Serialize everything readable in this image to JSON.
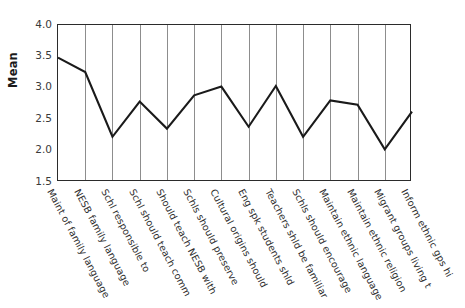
{
  "chart_data": {
    "type": "line",
    "title": "",
    "xlabel": "",
    "ylabel": "Mean",
    "ylim": [
      1.5,
      4.0
    ],
    "yticks": [
      "4.0",
      "3.5",
      "3.0",
      "2.5",
      "2.0",
      "1.5"
    ],
    "ytick_values": [
      4.0,
      3.5,
      3.0,
      2.5,
      2.0,
      1.5
    ],
    "grid": "vertical",
    "legend": "none",
    "categories": [
      "Maint of family language",
      "NESB family language",
      "Schl responsible to",
      "Schl should teach comm",
      "Should teach NESB with",
      "Schls should preserve",
      "Cultural origins should",
      "Eng spk students shld",
      "Teachers shld be familiar",
      "Schls should encourage",
      "Maintain ethnic language",
      "Maintain ethnic religion",
      "Migrant groups living t",
      "Inform ethnic gps hi"
    ],
    "values": [
      3.48,
      3.25,
      2.22,
      2.78,
      2.35,
      2.88,
      3.02,
      2.38,
      3.03,
      2.22,
      2.8,
      2.73,
      2.02,
      2.62
    ],
    "series_name": "Mean",
    "line_color": "#1a1a1a",
    "grid_color": "#8d8d8d",
    "axis_color": "#2b2b2b"
  }
}
